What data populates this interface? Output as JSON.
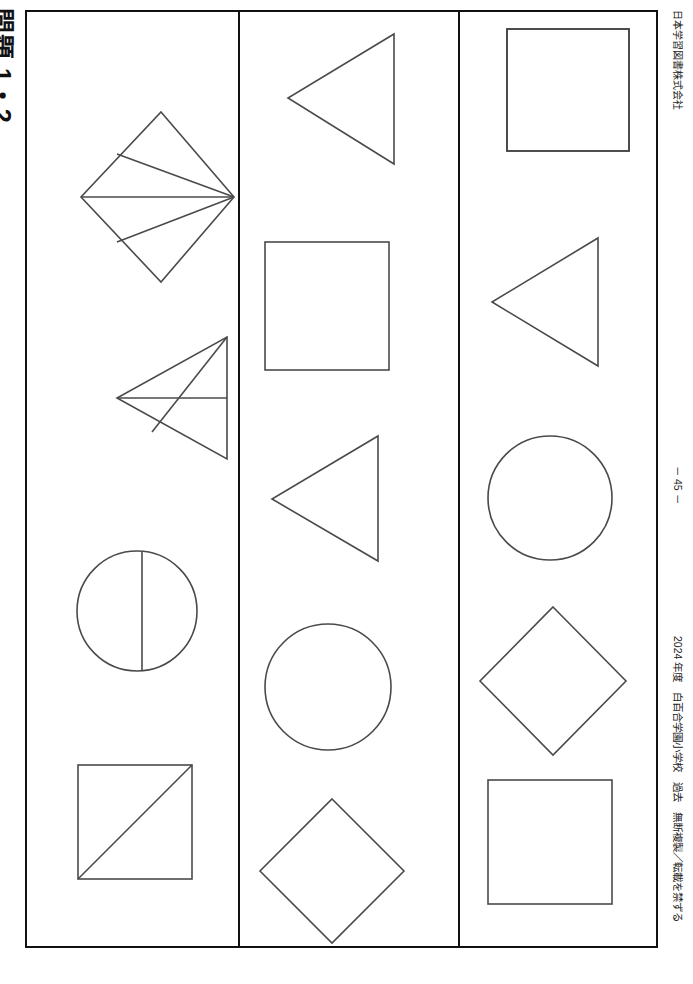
{
  "page": {
    "title_label": "問題 1・2",
    "publisher": "日本学習図書株式会社",
    "page_number": "－ 45 －",
    "copyright": "2024 年度　白百合学園小学校　過去　無断複製／転載を禁ずる",
    "frame_color": "#111111",
    "shape_stroke_color": "#4a4a4a",
    "background_color": "#ffffff"
  },
  "worksheet": {
    "columns": [
      {
        "id": "column-1",
        "shapes": [
          {
            "name": "diamond-with-radiating-lines",
            "kind": "diamond",
            "detail": "rotated square with three chords meeting at the right vertex",
            "x": 46,
            "y": 95,
            "w": 165,
            "h": 180
          },
          {
            "name": "left-pointing-triangle-with-internal-lines",
            "kind": "triangle-left",
            "detail": "left-pointing triangle crossed by a horizontal chord and an oblique chord",
            "x": 86,
            "y": 320,
            "w": 122,
            "h": 130
          },
          {
            "name": "circle-with-vertical-chord",
            "kind": "circle",
            "detail": "circle divided by a near-vertical chord right of centre",
            "x": 46,
            "y": 535,
            "w": 126,
            "h": 126
          },
          {
            "name": "square-with-diagonal",
            "kind": "square",
            "detail": "square with a diagonal from the bottom-left to the top-right corner",
            "x": 47,
            "y": 750,
            "w": 120,
            "h": 118
          }
        ]
      },
      {
        "id": "column-2",
        "shapes": [
          {
            "name": "left-pointing-triangle",
            "kind": "triangle-left",
            "detail": "plain left-pointing triangle",
            "x": 44,
            "y": 18,
            "w": 113,
            "h": 135
          },
          {
            "name": "square",
            "kind": "square",
            "detail": "plain square",
            "x": 22,
            "y": 227,
            "w": 126,
            "h": 130
          },
          {
            "name": "left-pointing-triangle-small",
            "kind": "triangle-left",
            "detail": "plain left-pointing triangle",
            "x": 28,
            "y": 420,
            "w": 113,
            "h": 130
          },
          {
            "name": "circle",
            "kind": "circle",
            "detail": "plain circle",
            "x": 22,
            "y": 609,
            "w": 131,
            "h": 131
          },
          {
            "name": "diamond",
            "kind": "diamond",
            "detail": "plain rotated square (diamond)",
            "x": 10,
            "y": 783,
            "w": 155,
            "h": 148
          }
        ]
      },
      {
        "id": "column-3",
        "shapes": [
          {
            "name": "square",
            "kind": "square",
            "detail": "plain square",
            "x": 44,
            "y": 14,
            "w": 124,
            "h": 124
          },
          {
            "name": "left-pointing-triangle",
            "kind": "triangle-left",
            "detail": "plain left-pointing triangle",
            "x": 28,
            "y": 222,
            "w": 112,
            "h": 133
          },
          {
            "name": "circle",
            "kind": "circle",
            "detail": "plain circle",
            "x": 25,
            "y": 421,
            "w": 128,
            "h": 128
          },
          {
            "name": "diamond",
            "kind": "diamond",
            "detail": "plain rotated square (diamond)",
            "x": 14,
            "y": 591,
            "w": 152,
            "h": 152
          },
          {
            "name": "square",
            "kind": "square",
            "detail": "plain square",
            "x": 25,
            "y": 765,
            "w": 126,
            "h": 126
          }
        ]
      }
    ]
  }
}
